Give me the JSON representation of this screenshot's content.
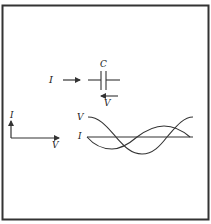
{
  "figure": {
    "frame_color": "#333333",
    "stroke_color": "#333333",
    "capacitor_circuit": {
      "current_label": "I",
      "capacitance_label": "C",
      "voltage_label": "V"
    },
    "phasor_diagram": {
      "vertical_axis_label": "I",
      "horizontal_axis_label": "V"
    },
    "waveforms": {
      "voltage_label": "V",
      "current_label": "I"
    }
  }
}
